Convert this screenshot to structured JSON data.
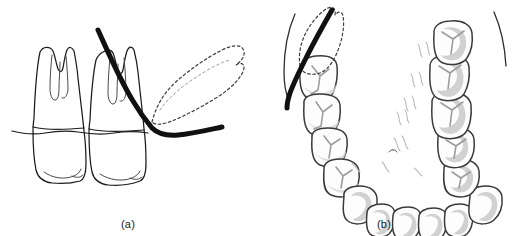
{
  "figure": {
    "background_color": "#ffffff",
    "panels": [
      {
        "id": "a",
        "caption": "(a)",
        "view": "buccal cross-section of two mandibular molars",
        "elements": [
          "molar-first",
          "molar-second",
          "alveolar-bone-crest-line",
          "instrument-blade-curve",
          "reflected-flap-dashed-outline"
        ]
      },
      {
        "id": "b",
        "caption": "(b)",
        "view": "occlusal view of mandibular dental arch",
        "elements": [
          "dental-arch-left-quadrant",
          "dental-arch-right-quadrant",
          "anterior-teeth",
          "incision-line",
          "flap-dashed-outline",
          "vestibule-lines",
          "lingual-tissue-marks"
        ]
      }
    ],
    "colors": {
      "ink": "#1c1c1c",
      "instrument": "#111111",
      "tooth_outline": "#3a3a3a",
      "tooth_fill": "#fdfdfd",
      "fissure_gray": "#9d9d9d",
      "shade_gray": "#c9c9c9",
      "dashed_flap": "#3d3d3d",
      "tissue_gray": "#b9b9b9"
    }
  },
  "captions": {
    "panel_a": "(a)",
    "panel_b": "(b)"
  }
}
